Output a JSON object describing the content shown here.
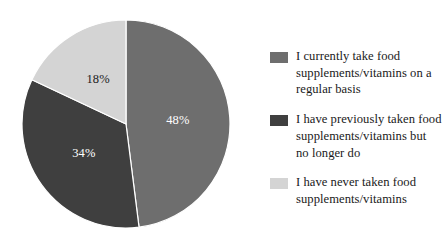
{
  "chart_data": {
    "type": "pie",
    "title": "",
    "subtitle": "",
    "xlabel": "",
    "ylabel": "",
    "grid": false,
    "legend_position": "right",
    "start_angle_deg": 0,
    "direction": "clockwise",
    "categories": [
      "I currently take food supplements/vitamins on a regular basis",
      "I have previously taken food supplements/vitamins but no longer do",
      "I have never taken food supplements/vitamins"
    ],
    "values": [
      48,
      34,
      18
    ],
    "value_labels": [
      "48%",
      "34%",
      "18%"
    ],
    "units": "percent",
    "total": 100,
    "colors": [
      "#6e6e6e",
      "#3f3f3f",
      "#d4d4d4"
    ],
    "slices": [
      {
        "label": "I currently take food supplements/vitamins on a regular basis",
        "value": 48,
        "display": "48%",
        "color": "#6e6e6e",
        "start_deg": 0,
        "end_deg": 172.8,
        "label_color": "#ffffff"
      },
      {
        "label": "I have previously taken food supplements/vitamins but no longer do",
        "value": 34,
        "display": "34%",
        "color": "#3f3f3f",
        "start_deg": 172.8,
        "end_deg": 295.2,
        "label_color": "#ffffff"
      },
      {
        "label": "I have never taken food supplements/vitamins",
        "value": 18,
        "display": "18%",
        "color": "#d4d4d4",
        "start_deg": 295.2,
        "end_deg": 360,
        "label_color": "#1c1c1c"
      }
    ]
  },
  "legend": {
    "items": [
      {
        "label": "I currently take food supplements/vitamins on a regular basis",
        "color": "#6e6e6e"
      },
      {
        "label": "I have previously taken food supplements/vitamins but no longer do",
        "color": "#3f3f3f"
      },
      {
        "label": "I have never taken food supplements/vitamins",
        "color": "#d4d4d4"
      }
    ]
  },
  "style": {
    "background": "#ffffff",
    "separator_color": "#ffffff",
    "text_color": "#1a1a1a"
  }
}
